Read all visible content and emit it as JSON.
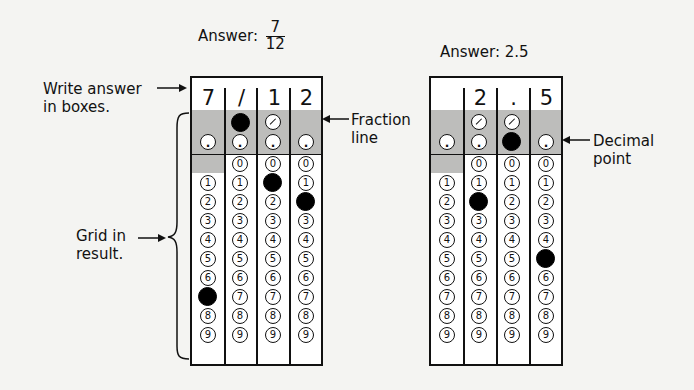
{
  "left_example": {
    "answer_label": "Answer:",
    "answer_numerator": "7",
    "answer_denominator": "12",
    "written_boxes": [
      "7",
      "/",
      "1",
      "2"
    ],
    "filled": {
      "col0": "7",
      "col1": "/",
      "col2": "1",
      "col3": "2"
    }
  },
  "right_example": {
    "answer_label": "Answer: 2.5",
    "written_boxes": [
      "",
      "2",
      ".",
      "5"
    ],
    "filled": {
      "col1": "2",
      "col2": ".",
      "col3": "5"
    }
  },
  "annotations": {
    "write_answer_line1": "Write answer",
    "write_answer_line2": "in boxes.",
    "grid_in_line1": "Grid in",
    "grid_in_line2": "result.",
    "fraction_line1": "Fraction",
    "fraction_line2": "line",
    "decimal_line1": "Decimal",
    "decimal_line2": "point"
  },
  "digits": [
    "0",
    "1",
    "2",
    "3",
    "4",
    "5",
    "6",
    "7",
    "8",
    "9"
  ],
  "colors": {
    "shade": "#bdbdbb",
    "ink": "#111111",
    "background": "#f4f4f2"
  }
}
